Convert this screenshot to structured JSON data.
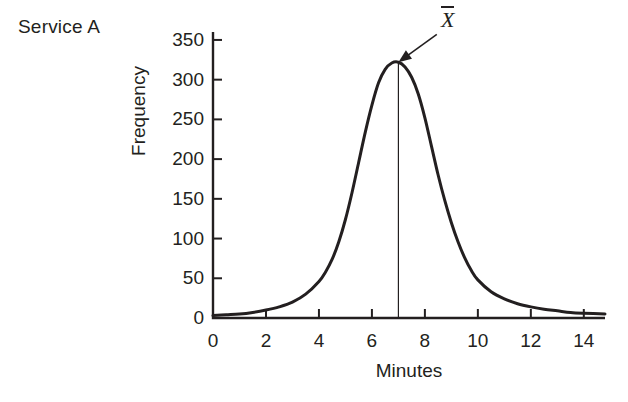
{
  "figure": {
    "series_label": "Service A",
    "mean_symbol": "X",
    "mean_symbol_name": "x-bar"
  },
  "chart_data": {
    "type": "line",
    "title": "Service A",
    "xlabel": "Minutes",
    "ylabel": "Frequency",
    "xlim": [
      0,
      14.8
    ],
    "ylim": [
      0,
      360
    ],
    "xticks": [
      0,
      2,
      4,
      6,
      8,
      10,
      12,
      14
    ],
    "xtick_labels": [
      "0",
      "2",
      "4",
      "6",
      "8",
      "10",
      "12",
      "14"
    ],
    "yticks": [
      0,
      50,
      100,
      150,
      200,
      250,
      300,
      350
    ],
    "ytick_labels": [
      "0",
      "50",
      "100",
      "150",
      "200",
      "250",
      "300",
      "350"
    ],
    "grid": false,
    "legend": false,
    "line_color": "#231f20",
    "line_width": 3,
    "series": [
      {
        "name": "Service A frequency distribution",
        "x": [
          0,
          0.5,
          1,
          1.5,
          2,
          2.5,
          3,
          3.5,
          4,
          4.25,
          4.5,
          4.75,
          5,
          5.25,
          5.5,
          5.75,
          6,
          6.25,
          6.5,
          6.75,
          7,
          7.25,
          7.5,
          7.75,
          8,
          8.25,
          8.5,
          8.75,
          9,
          9.25,
          9.5,
          9.75,
          10,
          10.5,
          11,
          11.5,
          12,
          12.5,
          13,
          13.5,
          14,
          14.8
        ],
        "y": [
          3,
          4,
          5,
          7,
          10,
          14,
          20,
          30,
          46,
          58,
          74,
          96,
          124,
          158,
          196,
          234,
          268,
          296,
          313,
          321,
          322,
          316,
          303,
          282,
          252,
          216,
          180,
          148,
          120,
          96,
          76,
          60,
          48,
          33,
          24,
          18,
          14,
          11,
          9,
          7,
          6,
          5
        ]
      }
    ],
    "annotations": [
      {
        "type": "vertical-line",
        "name": "mean-line",
        "x": 7,
        "y_from": 0,
        "y_to": 322,
        "line_width": 1
      },
      {
        "type": "arrow",
        "name": "mean-arrow",
        "label": "X",
        "points_to_x": 7,
        "points_to_y": 322,
        "tail_x": 8.45,
        "tail_y": 357
      }
    ]
  },
  "axis_titles": {
    "x": "Minutes",
    "y": "Frequency"
  }
}
